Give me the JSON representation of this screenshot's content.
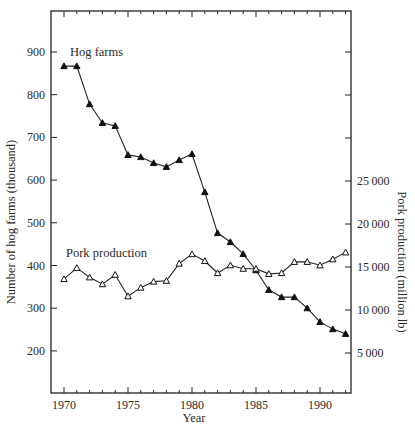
{
  "chart_data": {
    "type": "line",
    "title": "",
    "xlabel": "Year",
    "ylabel": "Number of hog farms (thousand)",
    "ylabel_right": "Pork production (million lb)",
    "x": [
      1970,
      1971,
      1972,
      1973,
      1974,
      1975,
      1976,
      1977,
      1978,
      1979,
      1980,
      1981,
      1982,
      1983,
      1984,
      1985,
      1986,
      1987,
      1988,
      1989,
      1990,
      1991,
      1992
    ],
    "xlim": [
      1969,
      1992.5
    ],
    "xticks": [
      1970,
      1975,
      1980,
      1985,
      1990
    ],
    "ylim_left": [
      100,
      1000
    ],
    "yticks_left": [
      200,
      300,
      400,
      500,
      600,
      700,
      800,
      900
    ],
    "yticks_right": [
      5000,
      10000,
      15000,
      20000,
      25000
    ],
    "grid": false,
    "legend": "inline labels",
    "series": [
      {
        "name": "Hog farms",
        "axis": "left",
        "marker": "filled-triangle",
        "values": [
          867,
          867,
          778,
          734,
          727,
          659,
          654,
          640,
          631,
          647,
          661,
          572,
          476,
          455,
          427,
          389,
          343,
          326,
          326,
          300,
          268,
          251,
          240
        ]
      },
      {
        "name": "Pork production",
        "axis": "right",
        "marker": "open-triangle",
        "values": [
          13600,
          14900,
          13800,
          13000,
          14100,
          11600,
          12600,
          13300,
          13400,
          15400,
          16500,
          15700,
          14300,
          15200,
          14800,
          14800,
          14200,
          14300,
          15600,
          15600,
          15200,
          15900,
          16700
        ]
      }
    ],
    "annotations": [
      {
        "text": "Hog farms",
        "series": 0
      },
      {
        "text": "Pork production",
        "series": 1
      }
    ]
  },
  "labels": {
    "xlabel": "Year",
    "ylabel_left": "Number of hog farms (thousand)",
    "ylabel_right": "Pork production (million lb)",
    "series_hog": "Hog farms",
    "series_pork": "Pork production"
  }
}
